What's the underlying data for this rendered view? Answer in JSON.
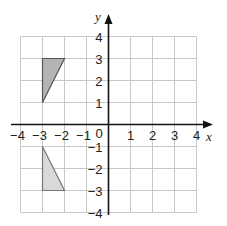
{
  "figure": {
    "type": "coordinate-grid",
    "x_axis": {
      "label": "x",
      "min": -4,
      "max": 4,
      "ticks": [
        "-4",
        "-3",
        "-2",
        "-1",
        "1",
        "2",
        "3",
        "4"
      ]
    },
    "y_axis": {
      "label": "y",
      "min": -4,
      "max": 4,
      "ticks_pos": [
        "1",
        "2",
        "3",
        "4"
      ],
      "ticks_neg": [
        "-1",
        "-2",
        "-3",
        "-4"
      ]
    },
    "origin_label": "0",
    "shapes": [
      {
        "name": "triangle-upper",
        "vertices": [
          [
            -3,
            3
          ],
          [
            -2,
            3
          ],
          [
            -3,
            1
          ]
        ],
        "fill": "#b4b4b4",
        "stroke": "#555555"
      },
      {
        "name": "triangle-lower",
        "vertices": [
          [
            -3,
            -1
          ],
          [
            -3,
            -3
          ],
          [
            -2,
            -3
          ]
        ],
        "fill": "#d9d9d9",
        "stroke": "#777777"
      }
    ],
    "colors": {
      "grid": "#c8c8c8",
      "axis": "#111111",
      "text": "#222222"
    }
  }
}
